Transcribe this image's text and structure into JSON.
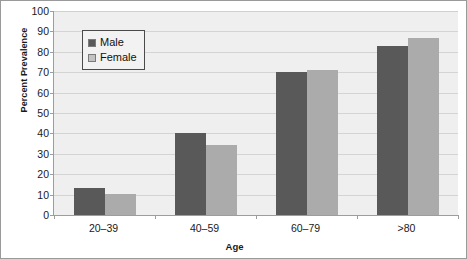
{
  "chart_data": {
    "type": "bar",
    "title": "",
    "xlabel": "Age",
    "ylabel": "Percent Prevalence",
    "categories": [
      "20–39",
      "40–59",
      "60–79",
      ">80"
    ],
    "series": [
      {
        "name": "Male",
        "color": "#595959",
        "values": [
          13,
          40,
          70,
          83
        ]
      },
      {
        "name": "Female",
        "color": "#ababab",
        "values": [
          10.5,
          34.5,
          71,
          87
        ]
      }
    ],
    "ylim": [
      0,
      100
    ],
    "yticks": [
      0,
      10,
      20,
      30,
      40,
      50,
      60,
      70,
      80,
      90,
      100
    ],
    "ytick_labels": [
      "0",
      "10",
      "20",
      "30",
      "40",
      "50",
      "60",
      "70",
      "80",
      "90",
      "100"
    ],
    "grid": true,
    "grid_axis": "y",
    "legend_position": "upper-left-inside",
    "plot_background": "#efefef",
    "frame_border": "#9a9a9a"
  },
  "legend": {
    "entries": [
      {
        "label": "Male",
        "swatch": "male-swatch"
      },
      {
        "label": "Female",
        "swatch": "female-swatch"
      }
    ]
  }
}
